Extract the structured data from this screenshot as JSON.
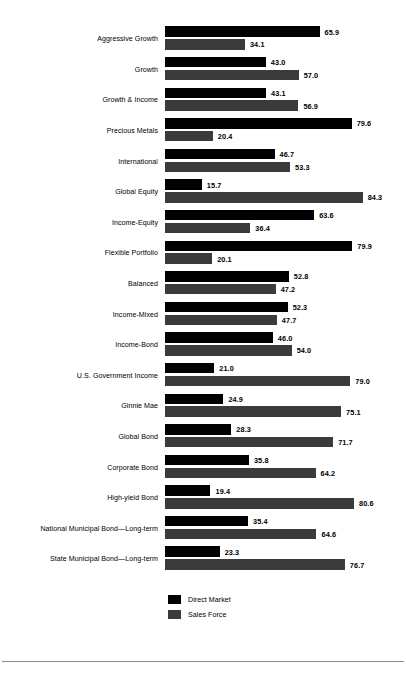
{
  "chart_data": {
    "type": "bar",
    "orientation": "horizontal",
    "grouping": "grouped",
    "title": "",
    "subtitle": "",
    "xlabel": "",
    "ylabel": "",
    "xlim": [
      0,
      100
    ],
    "grid": false,
    "legend_position": "bottom-left",
    "value_label_format": "one-decimal",
    "categories": [
      "Aggressive Growth",
      "Growth",
      "Growth & Income",
      "Precious Metals",
      "International",
      "Global Equity",
      "Income-Equity",
      "Flexible Portfolio",
      "Balanced",
      "Income-Mixed",
      "Income-Bond",
      "U.S. Government Income",
      "Ginnie Mae",
      "Global Bond",
      "Corporate Bond",
      "High-yield Bond",
      "National Municipal Bond—Long-term",
      "State Municipal Bond—Long-term"
    ],
    "series": [
      {
        "name": "Direct Market",
        "color": "#000000",
        "values": [
          65.9,
          43.0,
          43.1,
          79.6,
          46.7,
          15.7,
          63.6,
          79.9,
          52.8,
          52.3,
          46.0,
          21.0,
          24.9,
          28.3,
          35.8,
          19.4,
          35.4,
          23.3
        ],
        "labels": [
          "65.9",
          "43.0",
          "43.1",
          "79.6",
          "46.7",
          "15.7",
          "63.6",
          "79.9",
          "52.8",
          "52.3",
          "46.0",
          "21.0",
          "24.9",
          "28.3",
          "35.8",
          "19.4",
          "35.4",
          "23.3"
        ]
      },
      {
        "name": "Sales Force",
        "color": "#3b3b3b",
        "values": [
          34.1,
          57.0,
          56.9,
          20.4,
          53.3,
          84.3,
          36.4,
          20.1,
          47.2,
          47.7,
          54.0,
          79.0,
          75.1,
          71.7,
          64.2,
          80.6,
          64.6,
          76.7
        ],
        "labels": [
          "34.1",
          "57.0",
          "56.9",
          "20.4",
          "53.3",
          "84.3",
          "36.4",
          "20.1",
          "47.2",
          "47.7",
          "54.0",
          "79.0",
          "75.1",
          "71.7",
          "64.2",
          "80.6",
          "64.6",
          "76.7"
        ]
      }
    ]
  },
  "legend": {
    "items": [
      {
        "label": "Direct Market",
        "color": "#000000"
      },
      {
        "label": "Sales Force",
        "color": "#3b3b3b"
      }
    ]
  }
}
